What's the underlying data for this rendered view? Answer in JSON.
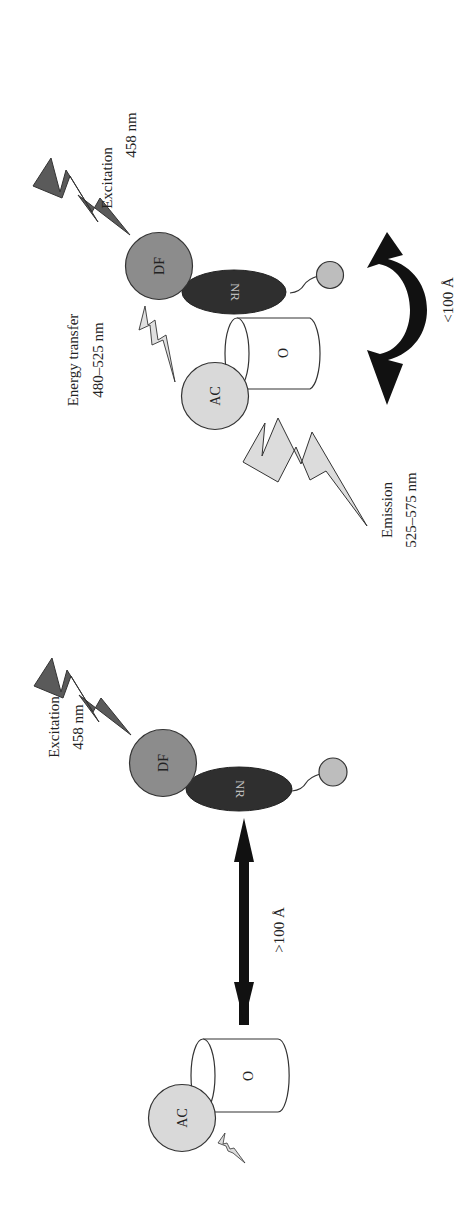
{
  "figure": {
    "colors": {
      "donor_fill": "#8c8c8c",
      "receptor_fill": "#2f2f2f",
      "acceptor_fill": "#d9d9d9",
      "ligand_fill": "#bdbdbd",
      "excitation_bolt": "#5a5a5a",
      "emission_bolt": "#dcdcdc",
      "arrow": "#111111"
    },
    "top_panel": {
      "excitation_label": "Excitation",
      "excitation_wavelength": "458 nm",
      "energy_transfer_label": "Energy transfer",
      "energy_transfer_wavelength": "480–525 nm",
      "emission_label": "Emission",
      "emission_wavelength": "525–575 nm",
      "distance_label": "<100 Å",
      "donor_label": "DF",
      "receptor_label": "NR",
      "acceptor_label": "AC",
      "cylinder_label": "O"
    },
    "bottom_panel": {
      "excitation_label": "Excitation",
      "excitation_wavelength": "458 nm",
      "distance_label": ">100 Å",
      "donor_label": "DF",
      "receptor_label": "NR",
      "acceptor_label": "AC",
      "cylinder_label": "O"
    }
  }
}
